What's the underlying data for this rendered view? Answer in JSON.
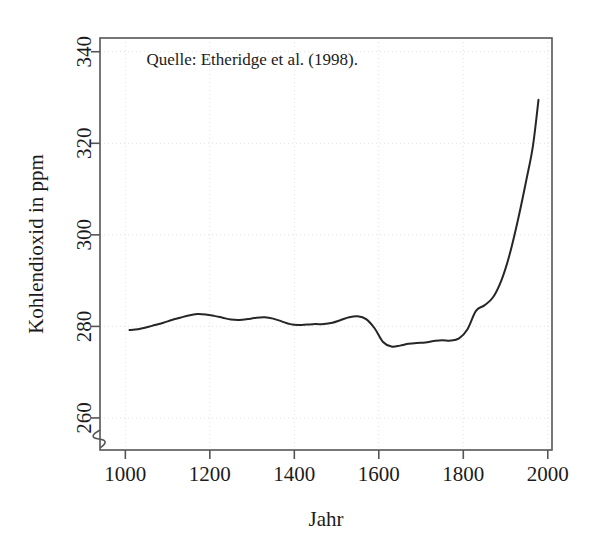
{
  "figure": {
    "background_color": "#ffffff",
    "frame_color": "#555555",
    "grid_color": "#e2e2e2",
    "line_color": "#262626"
  },
  "annotation": {
    "text": "Quelle: Etheridge et al. (1998).",
    "x_year": 1050,
    "y_ppm": 337
  },
  "axis_break": {
    "present": true,
    "axis": "y",
    "below_value": 260
  },
  "chart_data": {
    "type": "line",
    "title": "",
    "xlabel": "Jahr",
    "ylabel": "Kohlendioxid in ppm",
    "xlim": [
      940,
      2010
    ],
    "ylim": [
      253,
      343
    ],
    "xticks": [
      1000,
      1200,
      1400,
      1600,
      1800,
      2000
    ],
    "xtick_labels": [
      "1000",
      "1200",
      "1400",
      "1600",
      "1800",
      "2000"
    ],
    "yticks": [
      260,
      280,
      300,
      320,
      340
    ],
    "ytick_labels": [
      "260",
      "280",
      "300",
      "320",
      "340"
    ],
    "grid": true,
    "legend": false,
    "series": [
      {
        "name": "Kohlendioxid",
        "x": [
          1010,
          1030,
          1050,
          1070,
          1090,
          1110,
          1130,
          1150,
          1170,
          1190,
          1210,
          1230,
          1250,
          1270,
          1290,
          1310,
          1330,
          1350,
          1370,
          1390,
          1410,
          1430,
          1450,
          1470,
          1490,
          1510,
          1530,
          1550,
          1570,
          1590,
          1610,
          1630,
          1650,
          1670,
          1690,
          1710,
          1730,
          1750,
          1770,
          1790,
          1810,
          1830,
          1850,
          1870,
          1890,
          1910,
          1930,
          1950,
          1965,
          1978
        ],
        "y": [
          279.2,
          279.4,
          279.8,
          280.3,
          280.8,
          281.4,
          281.9,
          282.4,
          282.7,
          282.6,
          282.3,
          281.9,
          281.5,
          281.4,
          281.6,
          281.9,
          282.0,
          281.7,
          281.1,
          280.5,
          280.3,
          280.4,
          280.5,
          280.5,
          280.8,
          281.4,
          282.0,
          282.2,
          281.6,
          279.6,
          276.6,
          275.6,
          275.8,
          276.2,
          276.4,
          276.5,
          276.8,
          277.0,
          276.9,
          277.4,
          279.4,
          283.4,
          284.6,
          286.3,
          290.0,
          295.8,
          303.5,
          312.3,
          319.5,
          329.5
        ]
      }
    ]
  }
}
